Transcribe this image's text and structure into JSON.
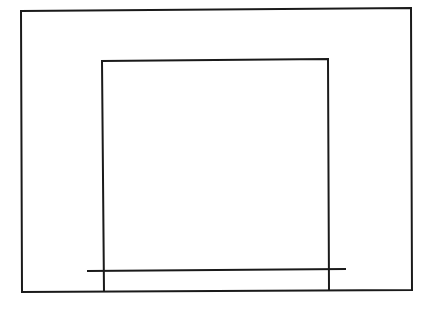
{
  "diagram": {
    "background": "#ffffff",
    "stroke": "#1a1a1a",
    "stroke_width": 2,
    "outer_rect": {
      "points": [
        [
          21,
          11
        ],
        [
          411,
          8
        ],
        [
          412,
          290
        ],
        [
          22,
          292
        ]
      ]
    },
    "inner_rect_open": {
      "points": [
        [
          104,
          292
        ],
        [
          102,
          61
        ],
        [
          328,
          59
        ],
        [
          329,
          291
        ]
      ]
    },
    "baseline": {
      "x1": 87,
      "y1": 271,
      "x2": 346,
      "y2": 269
    }
  }
}
